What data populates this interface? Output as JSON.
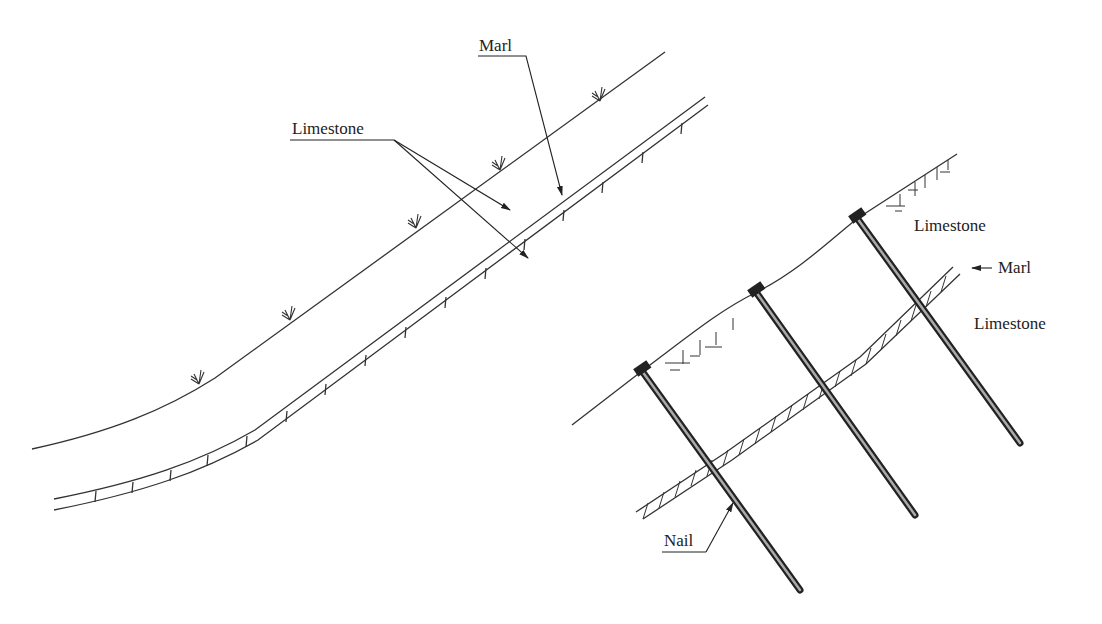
{
  "diagram": {
    "left_panel": {
      "title": "Natural slope with marl interlayer",
      "labels": {
        "marl": "Marl",
        "limestone": "Limestone"
      }
    },
    "right_panel": {
      "title": "Slope reinforced with soil nails",
      "labels": {
        "limestone_upper": "Limestone",
        "marl": "Marl",
        "limestone_lower": "Limestone",
        "nail": "Nail"
      },
      "nail_count": 3
    },
    "colors": {
      "line": "#333333",
      "nail_dark": "#222222",
      "nail_light": "#aaaaaa",
      "background": "#ffffff"
    }
  }
}
